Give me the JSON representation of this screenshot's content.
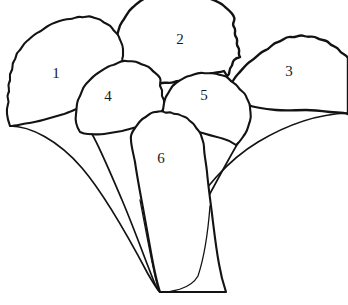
{
  "figure": {
    "background_color": "#ffffff",
    "ink_color": "#131313",
    "canvas": {
      "width": 348,
      "height": 305
    },
    "convergence_point": {
      "x": 160,
      "y": 292
    }
  },
  "labels": [
    {
      "id": "leaf-1",
      "text": "1",
      "x": 56,
      "y": 73
    },
    {
      "id": "leaf-2",
      "text": "2",
      "x": 180,
      "y": 39
    },
    {
      "id": "leaf-3",
      "text": "3",
      "x": 289,
      "y": 71
    },
    {
      "id": "leaf-4",
      "text": "4",
      "x": 108,
      "y": 96
    },
    {
      "id": "leaf-5",
      "text": "5",
      "x": 204,
      "y": 95
    },
    {
      "id": "leaf-6",
      "text": "6",
      "x": 161,
      "y": 158
    }
  ],
  "leaves": [
    {
      "number": "1",
      "name": "leaf-1",
      "position": "upper-left",
      "blade_path": "M 10 126 C 7 118 6 110 8 104 C 10 100 6 98 8 94 C 11 90 7 87 9 83 C 12 79 8 76 11 72 C 14 68 11 65 14 61 C 17 57 15 54 19 51 C 22 48 23 44 27 41 C 31 38 34 34 39 32 C 44 29 48 25 54 23 C 59 21 64 19 70 19 C 74 19 77 16 81 17 C 85 18 88 15 92 17 C 96 19 100 18 102 21 C 105 24 110 24 112 28 C 114 32 118 33 119 37 C 120 41 123 44 123 49 L 123 56 C 121 60 124 64 121 68 C 118 72 120 76 117 80 C 114 84 112 87 108 90 C 104 93 101 97 96 99 C 91 101 87 105 82 107 C 76 109 70 112 64 114 C 57 116 50 118 43 120 C 36 122 29 123 23 124 C 18 125 14 126 10 126 Z",
      "base_sweep_path": "M 10 126 C 24 118 44 121 62 128 C 82 136 104 152 122 176 C 140 200 152 230 158 266 C 160 280 160 288 160 292",
      "margin": "crenulate"
    },
    {
      "number": "2",
      "name": "leaf-2",
      "position": "top-center",
      "blade_path": "M 114 57 C 112 50 113 44 116 38 C 119 32 118 27 122 22 C 126 17 127 12 132 8 C 137 4 140 0 146 -2 L 208 -2 C 214 0 220 2 224 6 C 228 10 232 12 234 17 C 236 21 231 23 234 27 C 237 31 233 33 236 37 C 239 41 235 43 238 47 C 241 51 237 53 240 57 C 230 60 234 64 231 67 C 228 70 231 74 227 76 L 224 71 C 219 73 214 72 210 74 C 206 76 202 74 198 77 C 194 80 190 78 186 80 C 182 82 178 80 174 82 C 170 84 166 82 162 83 C 158 84 154 82 150 83 C 146 84 142 82 138 81 C 134 80 130 78 126 75 C 122 72 118 70 116 66 C 114 62 114 60 114 57 Z",
      "base_sweep_path": "M 227 76 C 230 80 231 84 232 88",
      "margin": "crenulate",
      "cropped_at_top": true
    },
    {
      "number": "3",
      "name": "leaf-3",
      "position": "upper-right",
      "blade_path": "M 228 90 C 231 84 234 78 238 74 C 242 70 246 64 251 61 C 256 58 260 52 266 50 C 271 48 272 43 278 42 C 283 41 285 36 291 37 C 296 38 299 34 304 36 C 309 38 313 35 317 38 C 321 41 326 39 329 43 C 332 47 337 46 339 50 C 341 54 346 54 348 58 L 348 114 C 342 112 336 113 330 112 C 322 111 314 110 306 110 C 296 110 286 111 276 110 C 266 109 256 108 248 105 C 241 102 236 99 232 95 C 229 92 228 91 228 90 Z",
      "base_sweep_path": "M 348 112 C 330 112 306 117 284 126 C 262 135 240 150 222 172 C 204 194 190 224 180 256 C 174 276 170 288 160 292",
      "margin": "crenulate",
      "cropped_at_right": true
    },
    {
      "number": "4",
      "name": "leaf-4",
      "position": "mid-left-center",
      "blade_path": "M 80 132 C 76 126 75 120 76 114 C 77 108 76 103 79 98 C 82 93 82 88 86 84 C 90 80 93 76 98 73 C 103 70 107 66 113 65 C 118 64 120 60 126 61 C 131 62 134 60 139 63 C 144 66 148 65 151 69 C 154 73 158 74 160 78 C 162 82 158 84 161 88 C 164 92 160 94 163 98 C 166 102 162 104 165 108 C 160 110 163 114 160 117 C 157 120 158 124 155 126 L 150 122 C 146 124 142 126 138 127 C 132 128 127 130 122 131 C 116 132 110 133 104 134 C 98 135 92 134 88 134 C 84 134 82 133 80 132 Z",
      "base_sweep_path": "M 80 132 C 90 140 100 152 112 176 C 124 200 136 232 146 262 C 152 280 156 288 160 292",
      "margin": "crenulate"
    },
    {
      "number": "5",
      "name": "leaf-5",
      "position": "mid-right-center",
      "blade_path": "M 168 127 C 164 121 162 116 163 110 C 164 104 164 99 167 95 C 170 91 171 86 176 83 C 181 80 184 77 189 76 C 194 75 197 72 203 73 C 208 74 212 72 217 74 C 222 76 226 75 229 79 C 232 83 236 83 238 87 C 240 91 245 92 246 96 C 247 100 250 102 250 107 C 250 112 252 116 250 121 C 248 126 248 130 245 134 C 242 138 240 142 236 145 C 232 142 228 140 224 139 C 218 137 212 136 206 134 C 200 132 194 131 188 130 C 182 129 176 128 172 128 C 170 128 169 128 168 127 Z",
      "base_sweep_path": "M 236 145 C 230 162 220 188 206 216 C 192 244 176 272 164 288 C 161 291 160 292 160 292",
      "margin": "crenulate"
    },
    {
      "number": "6",
      "name": "leaf-6",
      "position": "bottom-center",
      "blade_path": "M 131 140 C 130 136 132 132 135 128 C 138 124 140 120 144 118 C 148 116 150 112 155 112 C 159 112 161 110 164 112 C 167 114 169 111 172 113 C 175 115 177 113 180 115 C 183 117 186 116 188 119 C 190 122 193 122 195 126 C 197 130 200 131 201 135 C 202 139 204 142 204 147 C 204 154 206 162 207 172 C 208 184 210 198 212 214 C 214 230 216 248 219 264 C 221 276 224 286 226 292 L 160 292 C 158 286 155 274 152 258 C 149 242 146 224 143 208 C 140 192 137 176 135 162 C 133 152 131 145 131 140 Z",
      "base_sweep_path": "M 131 140 C 133 152 137 176 142 206",
      "margin": "crenulate",
      "base_shape": "cuneate"
    }
  ],
  "petioles": [
    {
      "name": "petiole-leaf-1",
      "path": "M 10 126 C 30 126 58 140 82 168 C 106 196 130 240 148 274 C 155 286 158 291 160 292"
    },
    {
      "name": "petiole-leaf-4",
      "path": "M 92 134 C 100 148 110 172 122 200 C 134 228 146 262 155 284 C 158 290 159 292 160 292"
    },
    {
      "name": "petiole-leaf-5",
      "path": "M 238 143 C 228 160 214 186 198 216 C 184 244 170 274 162 289 C 161 291 160 292 160 292"
    },
    {
      "name": "petiole-leaf-3",
      "path": "M 348 113 C 320 114 288 124 258 142 C 228 160 202 190 184 222 C 172 246 164 276 160 292"
    },
    {
      "name": "petiole-leaf-6-left",
      "path": "M 140 200 C 145 226 150 254 155 276 C 158 288 159 292 160 292"
    },
    {
      "name": "petiole-leaf-6-right",
      "path": "M 210 206 C 208 232 204 258 198 276 C 190 290 170 292 160 292"
    }
  ]
}
